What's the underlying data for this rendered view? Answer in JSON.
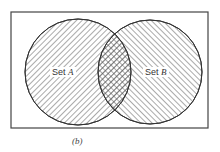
{
  "diagram": {
    "type": "venn",
    "caption": "(b)",
    "universe": {
      "x": 11,
      "y": 12,
      "width": 197,
      "height": 116
    },
    "sets": [
      {
        "id": "A",
        "prefix": "Set",
        "name": "A",
        "cx": 78,
        "cy": 72,
        "r": 53,
        "hatch": "diagonal-down"
      },
      {
        "id": "B",
        "prefix": "Set",
        "name": "B",
        "cx": 150,
        "cy": 72,
        "r": 52,
        "hatch": "diagonal-up"
      }
    ],
    "intersection": {
      "hatch": "cross",
      "highlighted": true
    },
    "colors": {
      "stroke": "#333333",
      "hatch": "#555555",
      "background": "#ffffff"
    }
  }
}
